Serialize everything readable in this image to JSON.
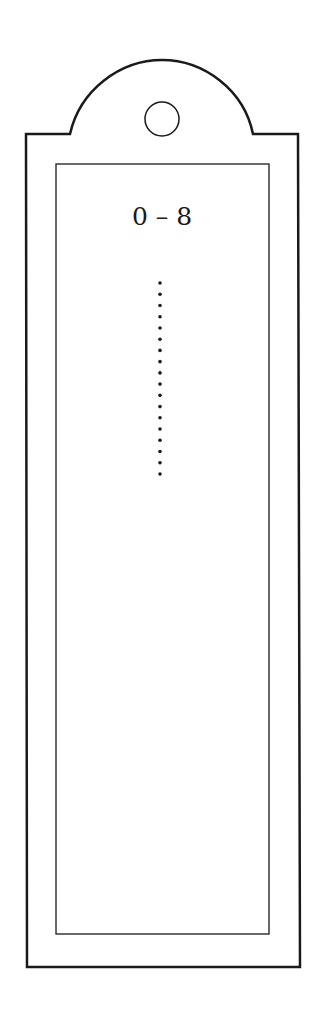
{
  "bookmark": {
    "label": "0 – 8",
    "hole_icon": "circle-hole-icon",
    "dots": {
      "count": 18,
      "x": 160,
      "start_y": 283,
      "end_y": 474
    },
    "colors": {
      "stroke": "#1a1a1a",
      "background": "#ffffff"
    }
  }
}
